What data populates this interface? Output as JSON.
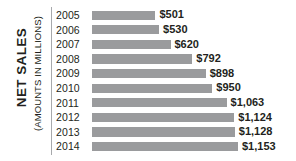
{
  "chart_data": {
    "type": "bar",
    "orientation": "horizontal",
    "title": "",
    "xlabel": "",
    "ylabel": "NET SALES",
    "ylabel_sub": "(AMOUNTS IN MILLIONS)",
    "grid": false,
    "legend": "none",
    "xlim": [
      0,
      1153
    ],
    "categories": [
      "2005",
      "2006",
      "2007",
      "2008",
      "2009",
      "2010",
      "2011",
      "2012",
      "2013",
      "2014"
    ],
    "values": [
      501,
      530,
      620,
      792,
      898,
      950,
      1063,
      1124,
      1128,
      1153
    ],
    "value_labels": [
      "$501",
      "$530",
      "$620",
      "$792",
      "$898",
      "$950",
      "$1,063",
      "$1,124",
      "$1,128",
      "$1,153"
    ],
    "bar_color": "#9a9b9d",
    "text_color": "#231f20",
    "axis_color": "#a7a9ac",
    "background": "#ffffff",
    "rows": [
      {
        "year": "2005",
        "value": 501,
        "label": "$501"
      },
      {
        "year": "2006",
        "value": 530,
        "label": "$530"
      },
      {
        "year": "2007",
        "value": 620,
        "label": "$620"
      },
      {
        "year": "2008",
        "value": 792,
        "label": "$792"
      },
      {
        "year": "2009",
        "value": 898,
        "label": "$898"
      },
      {
        "year": "2010",
        "value": 950,
        "label": "$950"
      },
      {
        "year": "2011",
        "value": 1063,
        "label": "$1,063"
      },
      {
        "year": "2012",
        "value": 1124,
        "label": "$1,124"
      },
      {
        "year": "2013",
        "value": 1128,
        "label": "$1,128"
      },
      {
        "year": "2014",
        "value": 1153,
        "label": "$1,153"
      }
    ]
  }
}
